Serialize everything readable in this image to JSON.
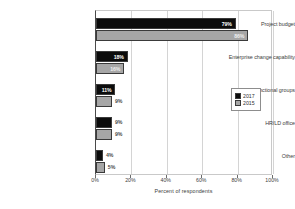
{
  "chart_data": {
    "type": "bar",
    "orientation": "horizontal",
    "title": "",
    "xlabel": "Percent of respondents",
    "ylabel": "",
    "xlim": [
      0,
      100
    ],
    "xticks": [
      "0%",
      "20%",
      "40%",
      "60%",
      "80%",
      "100%"
    ],
    "xtick_values": [
      0,
      20,
      40,
      60,
      80,
      100
    ],
    "grid": true,
    "legend_position": "right",
    "categories": [
      "Project budget",
      "Enterprise change capability",
      "Functional groups",
      "HR/LD office",
      "Other"
    ],
    "series": [
      {
        "name": "2017",
        "color": "#0c0c0c",
        "values": [
          79,
          18,
          11,
          9,
          4
        ],
        "labels": [
          "79%",
          "18%",
          "11%",
          "9%",
          "4%"
        ]
      },
      {
        "name": "2015",
        "color": "#a6a6a6",
        "values": [
          86,
          16,
          9,
          9,
          5
        ],
        "labels": [
          "86%",
          "16%",
          "9%",
          "9%",
          "5%"
        ]
      }
    ]
  },
  "legend": {
    "entries": [
      {
        "label": "2017",
        "color": "#0c0c0c"
      },
      {
        "label": "2015",
        "color": "#a6a6a6"
      }
    ]
  }
}
